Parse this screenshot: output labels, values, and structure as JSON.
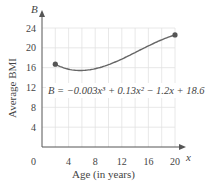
{
  "chart_data": {
    "type": "line",
    "title": "",
    "equation": "B = −0.003x³ + 0.13x² − 1.2x + 18.6",
    "xlabel": "Age (in years)",
    "ylabel": "Average BMI",
    "x_axis_var": "x",
    "y_axis_var": "B",
    "origin_label": "0",
    "xlim": [
      0,
      20
    ],
    "ylim": [
      0,
      24
    ],
    "x_ticks": [
      4,
      8,
      12,
      16,
      20
    ],
    "y_ticks": [
      4,
      8,
      12,
      16,
      20,
      24
    ],
    "x_tick_labels": [
      "4",
      "8",
      "12",
      "16",
      "20"
    ],
    "y_tick_labels": [
      "4",
      "8",
      "12",
      "16",
      "20",
      "24"
    ],
    "grid": true,
    "series": [
      {
        "name": "B",
        "x": [
          2,
          4,
          6,
          8,
          10,
          12,
          14,
          16,
          18,
          20
        ],
        "values": [
          16.7,
          15.7,
          15.3,
          15.4,
          15.6,
          16.5,
          17.7,
          19.2,
          20.6,
          21.8
        ],
        "endpoints": [
          [
            2,
            16.7
          ],
          [
            20,
            21.8
          ]
        ]
      }
    ]
  }
}
